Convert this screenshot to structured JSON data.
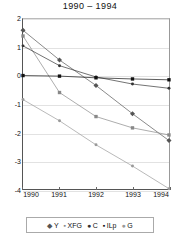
{
  "chart_data": {
    "type": "line",
    "title": "1990 – 1994",
    "xlabel": "",
    "ylabel": "",
    "x": [
      1990,
      1991,
      1992,
      1993,
      1994
    ],
    "xticklabels": [
      "1990",
      "1991",
      "1992",
      "1993",
      "1994"
    ],
    "yticklabels": [
      "2",
      "1",
      "0",
      "-1",
      "-2",
      "-3",
      "-4"
    ],
    "yticks": [
      2,
      1,
      0,
      -1,
      -2,
      -3,
      -4
    ],
    "xlim": [
      1990,
      1994
    ],
    "ylim": [
      -4,
      2
    ],
    "grid": true,
    "legend_position": "bottom",
    "series": [
      {
        "name": "Y",
        "marker": "diamond",
        "color": "#555555",
        "values": [
          1.6,
          0.55,
          -0.35,
          -1.35,
          -2.3
        ]
      },
      {
        "name": "XFG",
        "marker": "square",
        "color": "#888888",
        "values": [
          1.4,
          -0.6,
          -1.45,
          -1.85,
          -2.1
        ]
      },
      {
        "name": "C",
        "marker": "dot",
        "color": "#333333",
        "values": [
          1.05,
          0.35,
          -0.05,
          -0.3,
          -0.45
        ]
      },
      {
        "name": "ILp",
        "marker": "square",
        "color": "#111111",
        "values": [
          0.0,
          -0.02,
          -0.08,
          -0.12,
          -0.15
        ]
      },
      {
        "name": "G",
        "marker": "dot",
        "color": "#999999",
        "values": [
          -0.85,
          -1.6,
          -2.45,
          -3.2,
          -4.0
        ]
      }
    ]
  }
}
